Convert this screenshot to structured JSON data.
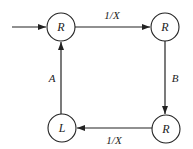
{
  "diagram": {
    "nodes": [
      {
        "id": "n1",
        "label": "R",
        "cx": 61,
        "cy": 27
      },
      {
        "id": "n2",
        "label": "R",
        "cx": 165,
        "cy": 27
      },
      {
        "id": "n3",
        "label": "R",
        "cx": 166,
        "cy": 129
      },
      {
        "id": "n4",
        "label": "L",
        "cx": 62,
        "cy": 128
      }
    ],
    "edges": [
      {
        "from": "input",
        "to": "n1",
        "label": ""
      },
      {
        "from": "n1",
        "to": "n2",
        "label": "1/X"
      },
      {
        "from": "n2",
        "to": "n3",
        "label": "B"
      },
      {
        "from": "n3",
        "to": "n4",
        "label": "1/X"
      },
      {
        "from": "n4",
        "to": "n1",
        "label": "A"
      }
    ],
    "colors": {
      "stroke": "#222222",
      "background": "#ffffff"
    }
  }
}
